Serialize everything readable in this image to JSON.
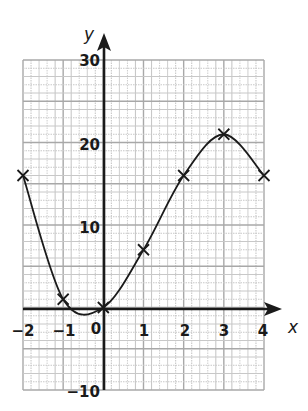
{
  "chart_data": {
    "type": "line",
    "title": "",
    "xlabel": "x",
    "ylabel": "y",
    "xlim": [
      -2,
      4
    ],
    "ylim": [
      -10,
      30
    ],
    "grid": true,
    "x_ticks": [
      "-2",
      "-1",
      "0",
      "1",
      "2",
      "3",
      "4"
    ],
    "y_ticks": [
      "30",
      "20",
      "10",
      "-10"
    ],
    "x": [
      -2,
      -1,
      0,
      1,
      2,
      3,
      4
    ],
    "y": [
      16,
      1,
      0,
      7,
      16,
      21,
      16
    ],
    "marker": "x",
    "curve": "smooth"
  },
  "labels": {
    "x_axis": "x",
    "y_axis": "y",
    "origin": "0",
    "x_tick_neg2": "−2",
    "x_tick_neg1": "−1",
    "x_tick_1": "1",
    "x_tick_2": "2",
    "x_tick_3": "3",
    "x_tick_4": "4",
    "y_tick_30": "30",
    "y_tick_20": "20",
    "y_tick_10": "10",
    "y_tick_neg10": "−10"
  },
  "colors": {
    "grid_major": "#a8a8a8",
    "grid_minor": "#c8c8c8",
    "axis": "#1a1a1a",
    "curve": "#1a1a1a"
  }
}
